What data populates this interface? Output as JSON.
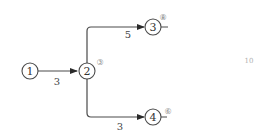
{
  "diagram": {
    "type": "activity-network",
    "nodes": [
      {
        "id": "1",
        "label": "1",
        "time": ""
      },
      {
        "id": "2",
        "label": "2",
        "time": "③"
      },
      {
        "id": "3",
        "label": "3",
        "time": "⑧"
      },
      {
        "id": "4",
        "label": "4",
        "time": "⑥"
      }
    ],
    "edges": [
      {
        "from": "1",
        "to": "2",
        "duration": "3"
      },
      {
        "from": "2",
        "to": "3",
        "duration": "5"
      },
      {
        "from": "2",
        "to": "4",
        "duration": "3"
      }
    ],
    "side_text": "10",
    "colors": {
      "line": "#4a4a4a",
      "text": "#333333",
      "time_text": "#8a8a8a"
    }
  }
}
